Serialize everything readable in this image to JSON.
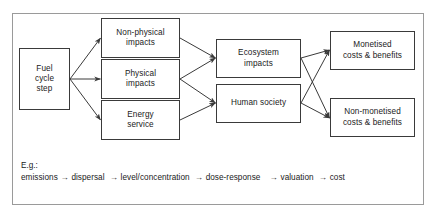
{
  "figure": {
    "frame_color": "#9a9a9a",
    "box_border_color": "#3a3a3a",
    "text_color": "#1a1a1a",
    "background": "#ffffff"
  },
  "nodes": {
    "fuel_cycle_step": {
      "line1": "Fuel",
      "line2": "cycle",
      "line3": "step"
    },
    "non_physical_impacts": {
      "line1": "Non-physical",
      "line2": "impacts"
    },
    "physical_impacts": {
      "line1": "Physical",
      "line2": "impacts"
    },
    "energy_service": {
      "line1": "Energy",
      "line2": "service"
    },
    "ecosystem_impacts": {
      "line1": "Ecosystem",
      "line2": "impacts"
    },
    "human_society": {
      "line1": "Human society"
    },
    "monetised": {
      "line1": "Monetised",
      "line2": "costs & benefits"
    },
    "non_monetised": {
      "line1": "Non-monetised",
      "line2": "costs & benefits"
    }
  },
  "legend": {
    "label": "E.g.:",
    "steps": [
      "emissions",
      "dispersal",
      "level/concentration",
      "dose-response",
      "valuation",
      "cost"
    ],
    "arrow_glyph": "→"
  },
  "edges": [
    {
      "from": "fuel_cycle_step",
      "to": "non_physical_impacts"
    },
    {
      "from": "fuel_cycle_step",
      "to": "physical_impacts"
    },
    {
      "from": "fuel_cycle_step",
      "to": "energy_service"
    },
    {
      "from": "non_physical_impacts",
      "to": "ecosystem_impacts"
    },
    {
      "from": "physical_impacts",
      "to": "ecosystem_impacts"
    },
    {
      "from": "physical_impacts",
      "to": "human_society"
    },
    {
      "from": "energy_service",
      "to": "human_society"
    },
    {
      "from": "ecosystem_impacts",
      "to": "monetised"
    },
    {
      "from": "ecosystem_impacts",
      "to": "non_monetised"
    },
    {
      "from": "human_society",
      "to": "monetised"
    },
    {
      "from": "human_society",
      "to": "non_monetised"
    }
  ]
}
